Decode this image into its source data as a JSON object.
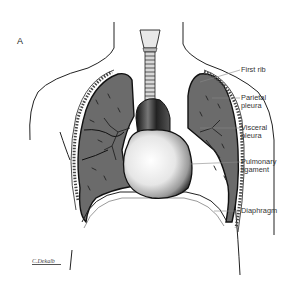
{
  "figure": {
    "panel_letter": "A",
    "signature": "C.Dekalb"
  },
  "labels": [
    {
      "id": "first-rib",
      "lines": [
        "First rib"
      ]
    },
    {
      "id": "parietal-pleura",
      "lines": [
        "Parietal",
        "pleura"
      ]
    },
    {
      "id": "visceral-pleura",
      "lines": [
        "Visceral",
        "pleura"
      ]
    },
    {
      "id": "pulmonary-ligament",
      "lines": [
        "Pulmonary",
        "ligament"
      ]
    },
    {
      "id": "diaphragm",
      "lines": [
        "Diaphragm"
      ]
    }
  ],
  "colors": {
    "lung_fill": "#6b6b6b",
    "outline": "#1a1a1a",
    "heart_light": "#f4f4f4",
    "heart_dark": "#2a2a2a",
    "leader_line": "#888888"
  }
}
